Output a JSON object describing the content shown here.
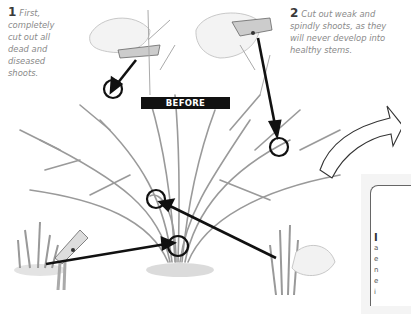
{
  "illustration": {
    "title_label": "BEFORE",
    "steps": [
      {
        "number": "1",
        "text": "First, completely cut out all dead and diseased shoots."
      },
      {
        "number": "2",
        "text": "Cut out weak and spindly shoots, as they will never develop into healthy stems."
      }
    ],
    "callout_circles": 5,
    "side_panel": {
      "drop_cap": "I",
      "partial_lines": [
        "a",
        "e",
        "n",
        "e",
        "i"
      ]
    },
    "colors": {
      "ink": "#111111",
      "text_grey": "#8a8a8a",
      "stem_grey": "#9a9a9a",
      "background": "#ffffff"
    }
  }
}
